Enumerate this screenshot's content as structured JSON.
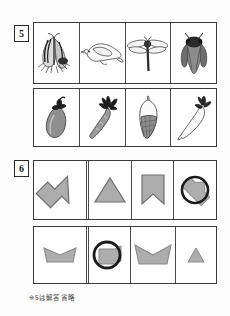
{
  "worksheet": {
    "caption": "※5は解答省略",
    "problems": [
      {
        "number": "5",
        "label_name": "problem-number-5",
        "rows": [
          {
            "row_name": "problem-5-row-1",
            "cells": [
              {
                "icon": "butterfly-icon",
                "label": "butterfly"
              },
              {
                "icon": "bird-icon",
                "label": "bird"
              },
              {
                "icon": "dragonfly-icon",
                "label": "dragonfly"
              },
              {
                "icon": "cicada-icon",
                "label": "cicada"
              }
            ]
          },
          {
            "row_name": "problem-5-row-2",
            "cells": [
              {
                "icon": "eggplant-icon",
                "label": "eggplant"
              },
              {
                "icon": "carrot-icon",
                "label": "carrot"
              },
              {
                "icon": "bamboo-shoot-icon",
                "label": "bamboo shoot"
              },
              {
                "icon": "daikon-radish-icon",
                "label": "daikon radish"
              }
            ]
          }
        ]
      },
      {
        "number": "6",
        "label_name": "problem-number-6",
        "rows": [
          {
            "row_name": "problem-6-row-1",
            "cells": [
              {
                "icon": "chevron-arrow-right-shape",
                "label": "large right chevron arrow"
              },
              {
                "icon": "triangle-shape",
                "label": "triangle"
              },
              {
                "icon": "pennant-banner-shape",
                "label": "pennant banner"
              },
              {
                "icon": "circled-chevron-shape",
                "label": "circled chevron"
              }
            ]
          },
          {
            "row_name": "problem-6-row-2",
            "cells": [
              {
                "icon": "boat-banner-shape",
                "label": "inverted banner"
              },
              {
                "icon": "circled-flag-shape",
                "label": "circled flag"
              },
              {
                "icon": "boat-banner-large-shape",
                "label": "large inverted banner"
              },
              {
                "icon": "small-triangle-shape",
                "label": "small triangle"
              }
            ]
          }
        ]
      }
    ]
  },
  "colors": {
    "shape_fill": "#adadad",
    "shape_stroke": "#6e6e6e",
    "circle_stroke": "#1c1c1c",
    "border": "#3a3a3a",
    "ink": "#2a2a2a"
  }
}
